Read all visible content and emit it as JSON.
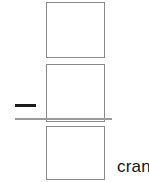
{
  "canvas": {
    "width": 149,
    "height": 182,
    "background_color": "#ffffff"
  },
  "boxes": [
    {
      "name": "box-top",
      "label": "",
      "border_color": "#8a8a8a",
      "fill_color": "#ffffff"
    },
    {
      "name": "box-middle",
      "label": "",
      "border_color": "#8a8a8a",
      "fill_color": "#ffffff"
    },
    {
      "name": "box-bottom",
      "label": "",
      "border_color": "#8a8a8a",
      "fill_color": "#ffffff"
    }
  ],
  "marks": {
    "dash": {
      "icon": "minus-dash-icon",
      "color": "#1b1b1b"
    },
    "rule": {
      "icon": "horizontal-rule-icon",
      "color": "#9a9a9a"
    }
  },
  "text": {
    "clipped_word": "cran"
  }
}
